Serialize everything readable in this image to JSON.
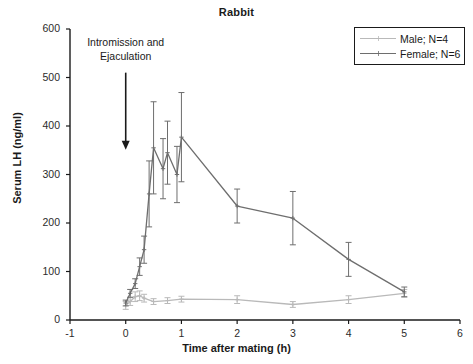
{
  "chart_data": {
    "type": "line",
    "title": "Rabbit",
    "xlabel": "Time after mating (h)",
    "ylabel": "Serum LH (ng/ml)",
    "xlim": [
      -1,
      6
    ],
    "ylim": [
      0,
      600
    ],
    "xticks": [
      -1,
      0,
      1,
      2,
      3,
      4,
      5,
      6
    ],
    "yticks": [
      0,
      100,
      200,
      300,
      400,
      500,
      600
    ],
    "xtick_labels": [
      "-1",
      "0",
      "1",
      "2",
      "3",
      "4",
      "5",
      "6"
    ],
    "ytick_labels": [
      "0",
      "100",
      "200",
      "300",
      "400",
      "500",
      "600"
    ],
    "grid": false,
    "legend_position": "top-right",
    "annotations": [
      {
        "text_line1": "Intromission and",
        "text_line2": "Ejaculation",
        "arrow": "down-arrow",
        "x": 0,
        "y_from": 510,
        "y_to": 355
      }
    ],
    "series": [
      {
        "name": "Male; N=4",
        "label": "Male; N=4",
        "color": "#b9b9b9",
        "marker": "cross",
        "x": [
          0,
          0.08,
          0.17,
          0.25,
          0.33,
          0.5,
          0.75,
          1,
          2,
          3,
          4,
          5
        ],
        "values": [
          30,
          38,
          48,
          50,
          45,
          38,
          40,
          43,
          42,
          32,
          42,
          55
        ],
        "errors": [
          8,
          8,
          10,
          10,
          8,
          6,
          6,
          6,
          8,
          6,
          8,
          8
        ]
      },
      {
        "name": "Female; N=6",
        "label": "Female; N=6",
        "color": "#6e6e6e",
        "marker": "cross",
        "x": [
          0,
          0.08,
          0.17,
          0.25,
          0.33,
          0.42,
          0.5,
          0.67,
          0.75,
          0.92,
          1,
          2,
          3,
          4,
          5
        ],
        "values": [
          35,
          55,
          75,
          110,
          145,
          260,
          355,
          312,
          345,
          300,
          377,
          235,
          210,
          125,
          58
        ],
        "errors": [
          6,
          8,
          10,
          18,
          28,
          68,
          95,
          62,
          65,
          58,
          92,
          35,
          55,
          35,
          10
        ]
      }
    ]
  },
  "legend": {
    "items": [
      {
        "label": "Male; N=4",
        "color": "#b9b9b9"
      },
      {
        "label": "Female; N=6",
        "color": "#6e6e6e"
      }
    ]
  },
  "axes": {
    "y_title": "Serum LH (ng/ml)",
    "x_title": "Time after mating (h)"
  },
  "title": "Rabbit"
}
